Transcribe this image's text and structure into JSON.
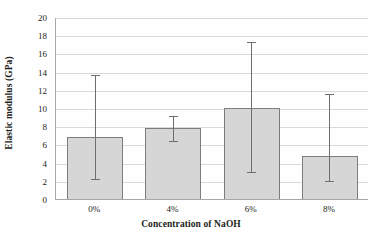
{
  "chart_data": {
    "type": "bar",
    "title": "",
    "xlabel": "Concentration of NaOH",
    "ylabel": "Elastic modulus (GPa)",
    "categories": [
      "0%",
      "4%",
      "6%",
      "8%"
    ],
    "values": [
      6.9,
      7.9,
      10.1,
      4.85
    ],
    "error_upper": [
      13.7,
      9.2,
      17.4,
      11.6
    ],
    "error_lower": [
      2.35,
      6.5,
      3.1,
      2.1
    ],
    "ylim": [
      0,
      20
    ],
    "ytick_labels": [
      "0",
      "2",
      "4",
      "6",
      "8",
      "10",
      "12",
      "14",
      "16",
      "18",
      "20"
    ],
    "ytick_values": [
      0,
      2,
      4,
      6,
      8,
      10,
      12,
      14,
      16,
      18,
      20
    ],
    "grid": true,
    "legend": "none",
    "colors": {
      "bar_fill": "#d6d6d6",
      "bar_border": "#7d7d7d",
      "gridline": "#d9d9d9",
      "axis": "#a6a6a6",
      "error_bar": "#6e6e6e",
      "text": "#231f20",
      "background": "#ffffff"
    }
  }
}
